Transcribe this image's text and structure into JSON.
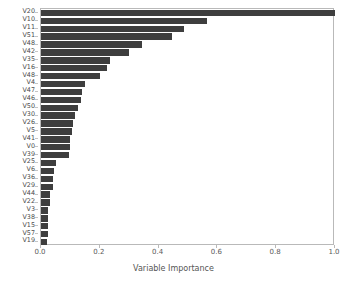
{
  "chart_data": {
    "type": "bar",
    "orientation": "horizontal",
    "title": "",
    "xlabel": "Variable Importance",
    "ylabel": "",
    "xlim": [
      0.0,
      1.0
    ],
    "xticks": [
      "0.0",
      "0.2",
      "0.4",
      "0.6",
      "0.8",
      "1.0"
    ],
    "xtick_values": [
      0.0,
      0.2,
      0.4,
      0.6,
      0.8,
      1.0
    ],
    "grid": false,
    "legend": null,
    "bar_color": "#3e3e3e",
    "background_color": "#ffffff",
    "categories": [
      "V20",
      "V10",
      "V11",
      "V51",
      "V48",
      "V42",
      "V35",
      "V16",
      "V48",
      "V4",
      "V47",
      "V46",
      "V50",
      "V30",
      "V26",
      "V5",
      "V41",
      "V0",
      "V39",
      "V25",
      "V6",
      "V36",
      "V29",
      "V44",
      "V22",
      "V3",
      "V38",
      "V15",
      "V57",
      "V19"
    ],
    "values": [
      1.0,
      0.565,
      0.485,
      0.445,
      0.345,
      0.3,
      0.235,
      0.225,
      0.2,
      0.15,
      0.14,
      0.135,
      0.125,
      0.115,
      0.11,
      0.105,
      0.1,
      0.1,
      0.095,
      0.05,
      0.045,
      0.04,
      0.04,
      0.03,
      0.03,
      0.025,
      0.025,
      0.025,
      0.025,
      0.02
    ]
  }
}
